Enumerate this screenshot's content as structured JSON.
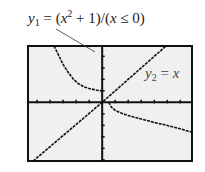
{
  "labels": {
    "y1": {
      "var": "y",
      "sub": "1",
      "eq": " = (",
      "x": "x",
      "sup": "2",
      "rest": " + 1)/(",
      "x2": "x",
      "cond": " ≤ 0)"
    },
    "y2": {
      "var": "y",
      "sub": "2",
      "eq": " = ",
      "x": "x"
    }
  },
  "colors": {
    "frame": "#111111",
    "plot_background": "#f0f0f0",
    "curve": "#111111",
    "leader": "#333333"
  },
  "chart_data": {
    "type": "line",
    "title": "",
    "xlabel": "",
    "ylabel": "",
    "xlim": [
      -5.7,
      6.9
    ],
    "ylim": [
      -5.1,
      4.9
    ],
    "grid": false,
    "x_ticks_spacing": 1,
    "y_ticks_spacing": 1,
    "series": [
      {
        "name": "y1 = (x^2 + 1)/(x ≤ 0)",
        "segments": [
          [
            [
              -3.7,
              4.9
            ],
            [
              -3.3,
              4.0
            ],
            [
              -3.0,
              3.3
            ],
            [
              -2.6,
              2.6
            ],
            [
              -2.2,
              2.0
            ],
            [
              -1.8,
              1.6
            ],
            [
              -1.4,
              1.35
            ],
            [
              -1.0,
              1.2
            ],
            [
              -0.4,
              1.05
            ],
            [
              0,
              1.0
            ]
          ],
          [
            [
              0.5,
              0.0
            ],
            [
              0.7,
              -0.4
            ],
            [
              1.0,
              -0.7
            ],
            [
              1.5,
              -0.95
            ],
            [
              2.0,
              -1.15
            ],
            [
              3.0,
              -1.45
            ],
            [
              4.0,
              -1.75
            ],
            [
              5.0,
              -2.0
            ],
            [
              6.0,
              -2.3
            ],
            [
              6.9,
              -2.6
            ]
          ]
        ]
      },
      {
        "name": "y2 = x",
        "segments": [
          [
            [
              -5.3,
              -5.1
            ],
            [
              0,
              0
            ],
            [
              4.9,
              4.9
            ]
          ]
        ]
      }
    ]
  }
}
